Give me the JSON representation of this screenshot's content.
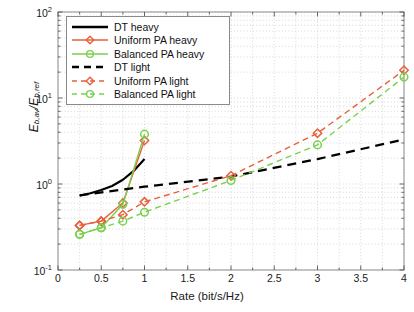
{
  "figure": {
    "background_color": "#ffffff",
    "frame_color": "#808080"
  },
  "chart_data": {
    "type": "line",
    "title": "",
    "xlabel": "Rate (bit/s/Hz)",
    "ylabel": "E_b,av / E_b,ref",
    "ylabel_main": "E",
    "ylabel_sub1": "b,av",
    "ylabel_slash": "/E",
    "ylabel_sub2": "b,ref",
    "xscale": "linear",
    "yscale": "log",
    "xlim": [
      0,
      4
    ],
    "ylim": [
      0.1,
      100
    ],
    "grid": true,
    "grid_style": "dotted",
    "legend_position": "upper left",
    "xticks": [
      "0",
      "0.5",
      "1",
      "1.5",
      "2",
      "2.5",
      "3",
      "3.5",
      "4"
    ],
    "xtick_values": [
      0,
      0.5,
      1,
      1.5,
      2,
      2.5,
      3,
      3.5,
      4
    ],
    "ytick_values": [
      0.1,
      1,
      10,
      100
    ],
    "yticks": [
      "10<sup>-1</sup>",
      "10<sup>0</sup>",
      "10<sup>1</sup>",
      "10<sup>2</sup>"
    ],
    "colors": {
      "black": "#000000",
      "red": "#e8603c",
      "green": "#79d14f"
    },
    "series": [
      {
        "name": "DT heavy",
        "color": "#000000",
        "linestyle": "solid",
        "marker": "none",
        "linewidth": 2.2,
        "x": [
          0.25,
          0.375,
          0.5,
          0.625,
          0.75,
          0.875,
          1.0
        ],
        "y": [
          0.73,
          0.78,
          0.85,
          0.95,
          1.12,
          1.42,
          1.95
        ]
      },
      {
        "name": "Uniform PA heavy",
        "color": "#e8603c",
        "linestyle": "solid",
        "marker": "diamond",
        "linewidth": 1.4,
        "x": [
          0.25,
          0.5,
          0.75,
          1.0
        ],
        "y": [
          0.33,
          0.37,
          0.6,
          3.2
        ]
      },
      {
        "name": "Balanced PA heavy",
        "color": "#79d14f",
        "linestyle": "solid",
        "marker": "circle",
        "linewidth": 1.4,
        "x": [
          0.25,
          0.5,
          0.75,
          1.0
        ],
        "y": [
          0.26,
          0.31,
          0.58,
          3.8
        ]
      },
      {
        "name": "DT light",
        "color": "#000000",
        "linestyle": "dashed",
        "marker": "none",
        "linewidth": 2.2,
        "x": [
          0.25,
          1.0,
          2.0,
          3.0,
          4.0
        ],
        "y": [
          0.74,
          0.93,
          1.22,
          1.95,
          3.3
        ]
      },
      {
        "name": "Uniform PA light",
        "color": "#e8603c",
        "linestyle": "dashed",
        "marker": "diamond",
        "linewidth": 1.4,
        "x": [
          0.25,
          0.5,
          0.75,
          1.0,
          2.0,
          3.0,
          4.0
        ],
        "y": [
          0.33,
          0.37,
          0.44,
          0.62,
          1.25,
          3.9,
          21.0
        ]
      },
      {
        "name": "Balanced PA light",
        "color": "#79d14f",
        "linestyle": "dashed",
        "marker": "circle",
        "linewidth": 1.4,
        "x": [
          0.25,
          0.5,
          0.75,
          1.0,
          2.0,
          3.0,
          4.0
        ],
        "y": [
          0.26,
          0.31,
          0.37,
          0.47,
          1.1,
          2.85,
          17.5
        ]
      }
    ]
  },
  "legend": {
    "items": [
      {
        "label": "DT heavy",
        "color": "#000000",
        "style": "solid",
        "marker": "none"
      },
      {
        "label": "Uniform PA heavy",
        "color": "#e8603c",
        "style": "solid",
        "marker": "diamond"
      },
      {
        "label": "Balanced PA heavy",
        "color": "#79d14f",
        "style": "solid",
        "marker": "circle"
      },
      {
        "label": "DT light",
        "color": "#000000",
        "style": "dashed",
        "marker": "none"
      },
      {
        "label": "Uniform PA light",
        "color": "#e8603c",
        "style": "dashed",
        "marker": "diamond"
      },
      {
        "label": "Balanced PA light",
        "color": "#79d14f",
        "style": "dashed",
        "marker": "circle"
      }
    ]
  }
}
